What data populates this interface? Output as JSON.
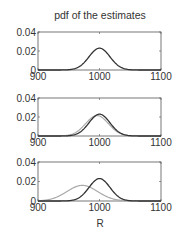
{
  "chart_data": {
    "type": "line",
    "title": "pdf of the estimates",
    "xlabel": "R",
    "ylabel": "",
    "xlim": [
      900,
      1100
    ],
    "ylim": [
      0,
      0.04
    ],
    "x_ticks": [
      "900",
      "1000",
      "1100"
    ],
    "y_ticks": [
      "0",
      "0.02",
      "0.04"
    ],
    "grid": false,
    "panels": [
      {
        "name": "panel-1",
        "series": [
          {
            "name": "dark",
            "color": "#333333",
            "mean": 1000,
            "std": 17,
            "peak": 0.023
          }
        ]
      },
      {
        "name": "panel-2",
        "series": [
          {
            "name": "gray",
            "color": "#aaaaaa",
            "mean": 996,
            "std": 18.5,
            "peak": 0.0215
          },
          {
            "name": "dark",
            "color": "#333333",
            "mean": 1000,
            "std": 17,
            "peak": 0.023
          }
        ]
      },
      {
        "name": "panel-3",
        "series": [
          {
            "name": "gray",
            "color": "#aaaaaa",
            "mean": 972,
            "std": 25,
            "peak": 0.016
          },
          {
            "name": "dark",
            "color": "#333333",
            "mean": 1000,
            "std": 17,
            "peak": 0.023
          }
        ]
      }
    ]
  }
}
